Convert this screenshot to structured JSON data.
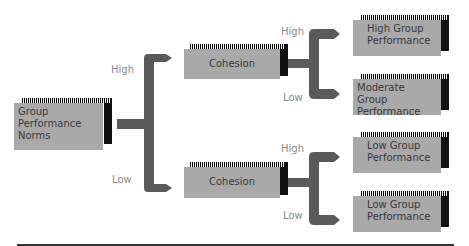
{
  "diagram": {
    "root": {
      "label_lines": [
        "Group",
        "Performance",
        "Norms"
      ]
    },
    "level1": [
      {
        "branch": "High",
        "label": "Cohesion"
      },
      {
        "branch": "Low",
        "label": "Cohesion"
      }
    ],
    "outcomes": [
      {
        "branch": "High",
        "lines": [
          "High Group",
          "Performance"
        ]
      },
      {
        "branch": "Low",
        "lines": [
          "Moderate Group",
          "Performance"
        ]
      },
      {
        "branch": "High",
        "lines": [
          "Low Group",
          "Performance"
        ]
      },
      {
        "branch": "Low",
        "lines": [
          "Low Group",
          "Performance"
        ]
      }
    ]
  },
  "colors": {
    "box": "#a9a9a9",
    "connector": "#5a5a5a",
    "shadow": "#111111",
    "label": "#8a8a8a"
  }
}
